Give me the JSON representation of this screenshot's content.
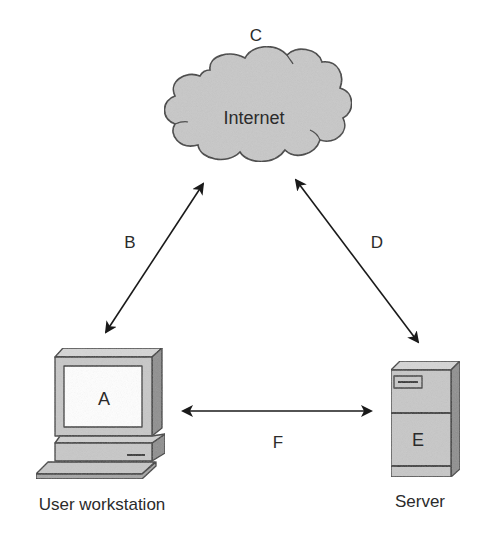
{
  "diagram": {
    "nodes": {
      "internet": {
        "letter": "C",
        "label": "Internet"
      },
      "workstation": {
        "letter": "A",
        "label": "User workstation"
      },
      "server": {
        "letter": "E",
        "label": "Server"
      }
    },
    "links": [
      {
        "id": "B",
        "label": "B",
        "from": "workstation",
        "to": "internet",
        "bidirectional": true
      },
      {
        "id": "D",
        "label": "D",
        "from": "internet",
        "to": "server",
        "bidirectional": true
      },
      {
        "id": "F",
        "label": "F",
        "from": "workstation",
        "to": "server",
        "bidirectional": true
      }
    ],
    "colors": {
      "fill_gray": "#c8c8c8",
      "side_dark": "#8e8e8e",
      "outline": "#3a3a3a",
      "screen": "#ffffff",
      "text": "#2b2b2b"
    }
  }
}
